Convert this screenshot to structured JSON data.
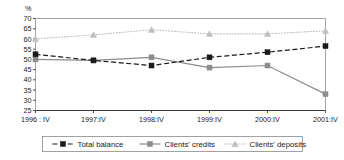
{
  "chart_data": {
    "type": "line",
    "title": "",
    "xlabel": "",
    "ylabel": "%",
    "ylim": [
      25,
      70
    ],
    "ytick_step": 5,
    "yticks": [
      25,
      30,
      35,
      40,
      45,
      50,
      55,
      60,
      65,
      70
    ],
    "grid": false,
    "legend_position": "bottom",
    "categories": [
      "1996 : IV",
      "1997:IV",
      "1998:IV",
      "1999:IV",
      "2000:IV",
      "2001:IV"
    ],
    "series": [
      {
        "name": "Total balance",
        "values": [
          52.5,
          49.5,
          47.0,
          51.0,
          53.5,
          56.5
        ],
        "color": "#1a1a1a",
        "line_style": "dashed",
        "marker": "square"
      },
      {
        "name": "Clients' credits",
        "values": [
          50.0,
          49.5,
          51.0,
          46.0,
          47.0,
          33.0
        ],
        "color": "#8c8c8c",
        "line_style": "solid",
        "marker": "square"
      },
      {
        "name": "Clients' deposits",
        "values": [
          60.0,
          62.0,
          64.5,
          62.5,
          62.5,
          64.0
        ],
        "color": "#bfbfbf",
        "line_style": "dotted",
        "marker": "triangle"
      }
    ]
  },
  "axis": {
    "unit_label": "%",
    "ytick_labels": [
      "70",
      "65",
      "60",
      "55",
      "50",
      "45",
      "40",
      "35",
      "30",
      "25"
    ],
    "xtick_labels": [
      "1996 : IV",
      "1997:IV",
      "1998:IV",
      "1999:IV",
      "2000:IV",
      "2001:IV"
    ]
  },
  "legend": {
    "items": [
      {
        "label": "Total balance"
      },
      {
        "label": "Clients' credits"
      },
      {
        "label": "Clients' deposits"
      }
    ]
  }
}
